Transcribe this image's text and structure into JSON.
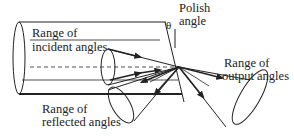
{
  "labels": {
    "polish_angle_line1": "Polish",
    "polish_angle_line2": "angle",
    "theta": "θ",
    "incident_line1": "Range of",
    "incident_line2": "incident angles",
    "output_line1": "Range of",
    "output_line2": "output angles",
    "reflected_line1": "Range of",
    "reflected_line2": "reflected angles"
  },
  "colors": {
    "stroke": "#222222",
    "text": "#222222",
    "background": "#ffffff"
  }
}
